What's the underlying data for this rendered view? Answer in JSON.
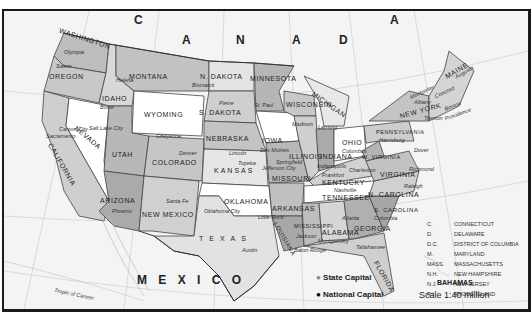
{
  "countries": {
    "canada_letters": [
      "C",
      "A",
      "N",
      "A",
      "D",
      "A"
    ],
    "mexico": "M E X I C O",
    "bahamas": "BAHAMAS"
  },
  "features": {
    "tropic": "Tropic of Cancer"
  },
  "states": [
    {
      "name": "WASHINGTON",
      "capital": "Olympia"
    },
    {
      "name": "OREGON",
      "capital": "Salem"
    },
    {
      "name": "CALIFORNIA",
      "capital": "Sacramento"
    },
    {
      "name": "NEVADA",
      "capital": "Carson City"
    },
    {
      "name": "IDAHO",
      "capital": "Boise"
    },
    {
      "name": "MONTANA",
      "capital": "Helena"
    },
    {
      "name": "WYOMING",
      "capital": "Cheyenne"
    },
    {
      "name": "UTAH",
      "capital": "Salt Lake City"
    },
    {
      "name": "ARIZONA",
      "capital": "Phoenix"
    },
    {
      "name": "COLORADO",
      "capital": "Denver"
    },
    {
      "name": "NEW MEXICO",
      "capital": "Santa Fe"
    },
    {
      "name": "N. DAKOTA",
      "capital": "Bismarck"
    },
    {
      "name": "S. DAKOTA",
      "capital": "Pierre"
    },
    {
      "name": "NEBRASKA",
      "capital": "Lincoln"
    },
    {
      "name": "KANSAS",
      "capital": "Topeka"
    },
    {
      "name": "OKLAHOMA",
      "capital": "Oklahoma City"
    },
    {
      "name": "TEXAS",
      "capital": "Austin"
    },
    {
      "name": "MINNESOTA",
      "capital": "St. Paul"
    },
    {
      "name": "IOWA",
      "capital": "Des Moines"
    },
    {
      "name": "MISSOURI",
      "capital": "Jefferson City"
    },
    {
      "name": "ARKANSAS",
      "capital": "Little Rock"
    },
    {
      "name": "LOUISIANA",
      "capital": "Baton Rouge"
    },
    {
      "name": "WISCONSIN",
      "capital": "Madison"
    },
    {
      "name": "ILLINOIS",
      "capital": "Springfield"
    },
    {
      "name": "MICHIGAN",
      "capital": "Lansing"
    },
    {
      "name": "INDIANA",
      "capital": "Indianapolis"
    },
    {
      "name": "OHIO",
      "capital": "Columbus"
    },
    {
      "name": "KENTUCKY",
      "capital": "Frankfort"
    },
    {
      "name": "TENNESSEE",
      "capital": "Nashville"
    },
    {
      "name": "MISSISSIPPI",
      "capital": "Jackson"
    },
    {
      "name": "ALABAMA",
      "capital": "Montgomery"
    },
    {
      "name": "GEORGIA",
      "capital": "Atlanta"
    },
    {
      "name": "FLORIDA",
      "capital": "Tallahassee"
    },
    {
      "name": "S. CAROLINA",
      "capital": "Columbia"
    },
    {
      "name": "N. CAROLINA",
      "capital": "Raleigh"
    },
    {
      "name": "VIRGINIA",
      "capital": "Richmond"
    },
    {
      "name": "W. VIRGINIA",
      "capital": "Charleston"
    },
    {
      "name": "PENNSYLVANIA",
      "capital": "Harrisburg"
    },
    {
      "name": "NEW YORK",
      "capital": "Albany"
    },
    {
      "name": "MAINE",
      "capital": "Augusta"
    },
    {
      "name": "VER.",
      "capital": "Montpelier"
    },
    {
      "name": "N.H.",
      "capital": "Concord"
    },
    {
      "name": "MASS.",
      "capital": "Boston"
    },
    {
      "name": "R.I.",
      "capital": "Providence"
    },
    {
      "name": "C.",
      "capital": "Hartford"
    },
    {
      "name": "N.J.",
      "capital": "Trenton"
    },
    {
      "name": "D.",
      "capital": "Dover"
    },
    {
      "name": "M.",
      "capital": "Annapolis"
    },
    {
      "name": "D.C.",
      "capital": "Washington"
    }
  ],
  "abbreviations": [
    {
      "abbr": "C.",
      "full": "CONNECTICUT"
    },
    {
      "abbr": "D.",
      "full": "DELAWARE"
    },
    {
      "abbr": "D.C.",
      "full": "DISTRICT OF COLUMBIA"
    },
    {
      "abbr": "M.",
      "full": "MARYLAND"
    },
    {
      "abbr": "MASS.",
      "full": "MASSACHUSETTS"
    },
    {
      "abbr": "N.H.",
      "full": "NEW HAMPSHIRE"
    },
    {
      "abbr": "N.J.",
      "full": "NEW JERSEY"
    },
    {
      "abbr": "R.I.",
      "full": "RHODE ISLAND"
    },
    {
      "abbr": "VER.",
      "full": "VERMONT"
    }
  ],
  "legend": {
    "state_capital": "State Capital",
    "national_capital": "National Capital",
    "scale": "Scale 1:40 million"
  },
  "grid_labels": {
    "longitudes": [
      "120",
      "110",
      "100",
      "90",
      "80",
      "70",
      "60"
    ],
    "latitudes": [
      "50",
      "40",
      "30",
      "20"
    ]
  }
}
